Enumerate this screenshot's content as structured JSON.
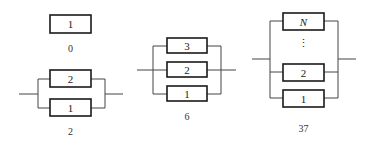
{
  "diagrams": [
    {
      "caption": "0",
      "components": [
        "1"
      ],
      "topology": "single"
    },
    {
      "caption": "2",
      "components": [
        "2",
        "1"
      ],
      "topology": "parallel"
    },
    {
      "caption": "6",
      "components": [
        "3",
        "2",
        "1"
      ],
      "topology": "parallel"
    },
    {
      "caption": "37",
      "components": [
        "N",
        "⋮",
        "2",
        "1"
      ],
      "topology": "parallel"
    }
  ],
  "colors": {
    "stroke": "#1a1a1a",
    "wire": "#444444",
    "background": "#ffffff"
  }
}
